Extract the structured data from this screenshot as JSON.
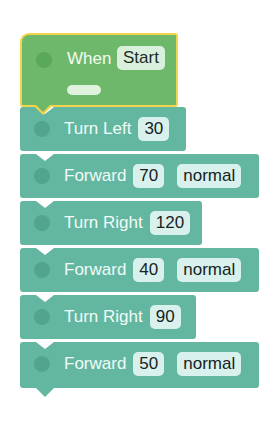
{
  "hat_block": {
    "label": "When",
    "value": "Start",
    "colors": {
      "fill": "#6db86a",
      "border": "#f2d54a"
    }
  },
  "blocks": [
    {
      "label": "Turn Left",
      "value": "30",
      "mode": null
    },
    {
      "label": "Forward",
      "value": "70",
      "mode": "normal"
    },
    {
      "label": "Turn Right",
      "value": "120",
      "mode": null
    },
    {
      "label": "Forward",
      "value": "40",
      "mode": "normal"
    },
    {
      "label": "Turn Right",
      "value": "90",
      "mode": null
    },
    {
      "label": "Forward",
      "value": "50",
      "mode": "normal"
    }
  ],
  "colors": {
    "block_fill": "#63b7a0",
    "pill_fill": "#d8f1ec"
  }
}
